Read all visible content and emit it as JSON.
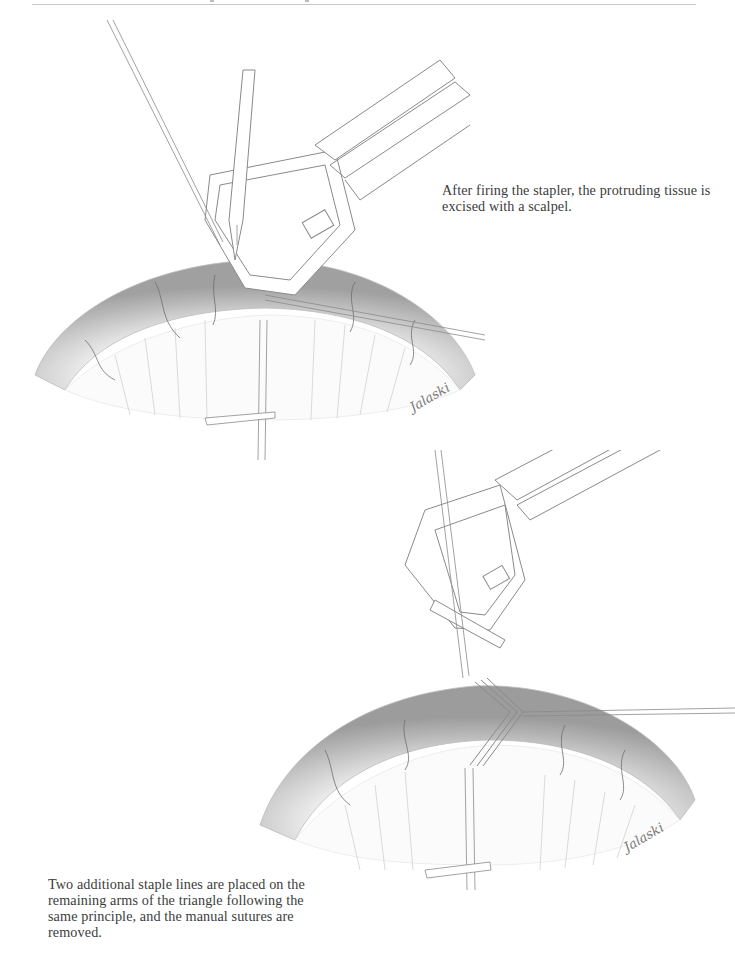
{
  "page": {
    "header": {
      "rule_visible": true
    }
  },
  "figures": [
    {
      "id": "top",
      "caption": "After firing the stapler, the protruding tissue is excised with a scalpel.",
      "illustration": "stapler-with-scalpel-excising-tissue",
      "signature": "Jalaski"
    },
    {
      "id": "bottom",
      "caption": "Two additional staple lines are placed on the remaining arms of the triangle following the same principle, and the manual sutures are removed.",
      "illustration": "stapler-completed-staple-lines",
      "signature": "Jalaski"
    }
  ],
  "colors": {
    "line": "#8a8a8a",
    "tissue_dark": "#9a9a9a",
    "tissue_light": "#e6e6e6",
    "text": "#3c3c3c"
  }
}
